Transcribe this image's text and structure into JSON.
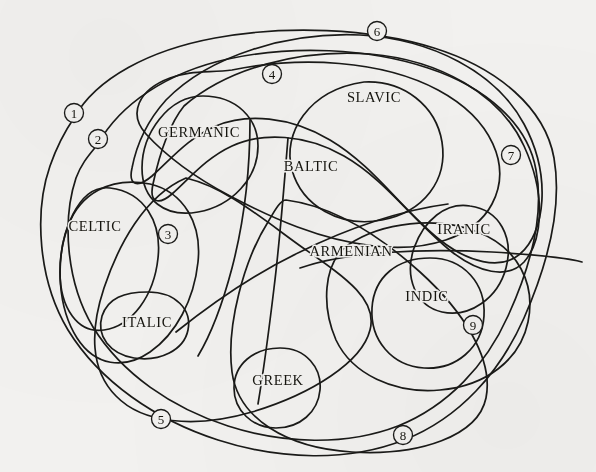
{
  "diagram": {
    "background_color": "#f2f1ef",
    "stroke_color": "#1a1a18",
    "branches": [
      {
        "id": "germanic",
        "label": "GERMANIC",
        "x": 199,
        "y": 134
      },
      {
        "id": "slavic",
        "label": "SLAVIC",
        "x": 374,
        "y": 99
      },
      {
        "id": "baltic",
        "label": "BALTIC",
        "x": 311,
        "y": 168
      },
      {
        "id": "celtic",
        "label": "CELTIC",
        "x": 95,
        "y": 228
      },
      {
        "id": "iranic",
        "label": "IRANIC",
        "x": 464,
        "y": 231
      },
      {
        "id": "armenian",
        "label": "ARMENIAN",
        "x": 351,
        "y": 253
      },
      {
        "id": "indic",
        "label": "INDIC",
        "x": 427,
        "y": 298
      },
      {
        "id": "italic",
        "label": "ITALIC",
        "x": 147,
        "y": 324
      },
      {
        "id": "greek",
        "label": "GREEK",
        "x": 278,
        "y": 382
      }
    ],
    "isogloss_markers": [
      {
        "id": "1",
        "label": "1",
        "x": 74,
        "y": 113
      },
      {
        "id": "2",
        "label": "2",
        "x": 98,
        "y": 139
      },
      {
        "id": "3",
        "label": "3",
        "x": 168,
        "y": 234
      },
      {
        "id": "4",
        "label": "4",
        "x": 272,
        "y": 74
      },
      {
        "id": "5",
        "label": "5",
        "x": 161,
        "y": 419
      },
      {
        "id": "6",
        "label": "6",
        "x": 377,
        "y": 31
      },
      {
        "id": "7",
        "label": "7",
        "x": 511,
        "y": 155
      },
      {
        "id": "8",
        "label": "8",
        "x": 403,
        "y": 435
      },
      {
        "id": "9",
        "label": "9",
        "x": 473,
        "y": 325
      }
    ]
  }
}
